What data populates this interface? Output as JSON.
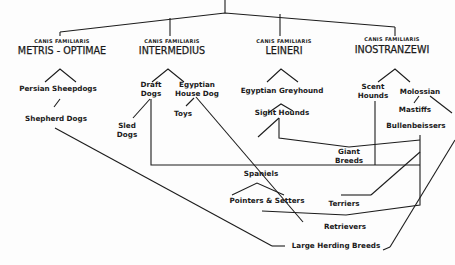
{
  "diagram": {
    "species_prefix": "CANIS FAMILIARIS",
    "groups": [
      {
        "species": "CANIS FAMILIARIS",
        "name": "METRIS - OPTIMAE"
      },
      {
        "species": "CANIS FAMILIARIS",
        "name": "INTERMEDIUS"
      },
      {
        "species": "CANIS FAMILIARIS",
        "name": "LEINERI"
      },
      {
        "species": "CANIS FAMILIARIS",
        "name": "INOSTRANZEWI"
      }
    ],
    "nodes": {
      "persian_sheepdogs": "Persian Sheepdogs",
      "shepherd_dogs": "Shepherd Dogs",
      "draft_dogs_1": "Draft",
      "draft_dogs_2": "Dogs",
      "egyptian_house_dog_1": "Egyptian",
      "egyptian_house_dog_2": "House Dog",
      "toys": "Toys",
      "sled_dogs_1": "Sled",
      "sled_dogs_2": "Dogs",
      "egyptian_greyhound": "Egyptian Greyhound",
      "sight_hounds": "Sight Hounds",
      "scent_hounds_1": "Scent",
      "scent_hounds_2": "Hounds",
      "molossian": "Molossian",
      "mastiffs": "Mastiffs",
      "bullenbeissers": "Bullenbeissers",
      "giant_breeds_1": "Giant",
      "giant_breeds_2": "Breeds",
      "spaniels": "Spaniels",
      "pointers_setters": "Pointers & Setters",
      "terriers": "Terriers",
      "retrievers": "Retrievers",
      "large_herding_breeds": "Large Herding Breeds"
    }
  }
}
